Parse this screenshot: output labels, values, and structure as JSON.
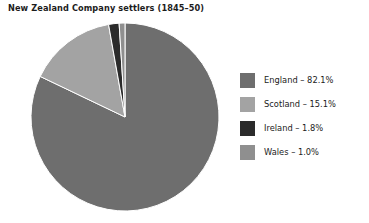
{
  "chart_data": {
    "type": "pie",
    "title": "New Zealand Company settlers (1845–50)",
    "xlabel": "",
    "ylabel": "",
    "legend_position": "right",
    "grid": false,
    "start_angle_deg": 0,
    "direction": "clockwise",
    "categories": [
      "England",
      "Scotland",
      "Ireland",
      "Wales"
    ],
    "values": [
      82.1,
      15.1,
      1.8,
      1.0
    ],
    "value_suffix": "%",
    "colors": [
      "#6e6e6e",
      "#a3a3a3",
      "#2b2b2b",
      "#8f8f8f"
    ],
    "slices": [
      {
        "label": "England",
        "value": 82.1,
        "display": "82.1%",
        "color": "#6e6e6e",
        "legend_text": "England – 82.1%"
      },
      {
        "label": "Scotland",
        "value": 15.1,
        "display": "15.1%",
        "color": "#a3a3a3",
        "legend_text": "Scotland – 15.1%"
      },
      {
        "label": "Ireland",
        "value": 1.8,
        "display": "1.8%",
        "color": "#2b2b2b",
        "legend_text": "Ireland – 1.8%"
      },
      {
        "label": "Wales",
        "value": 1.0,
        "display": "1.0%",
        "color": "#8f8f8f",
        "legend_text": "Wales – 1.0%"
      }
    ]
  },
  "legend": {
    "items": [
      {
        "text": "England – 82.1%",
        "color": "#6e6e6e"
      },
      {
        "text": "Scotland – 15.1%",
        "color": "#a3a3a3"
      },
      {
        "text": "Ireland – 1.8%",
        "color": "#2b2b2b"
      },
      {
        "text": "Wales – 1.0%",
        "color": "#8f8f8f"
      }
    ]
  }
}
